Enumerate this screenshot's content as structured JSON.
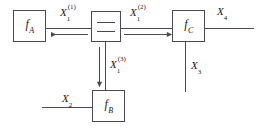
{
  "diagram": {
    "nodes": [
      {
        "id": "f_A",
        "label": "f",
        "subscript": "A",
        "name": "factor-node-fa"
      },
      {
        "id": "equality",
        "label": "=",
        "name": "equality-node"
      },
      {
        "id": "f_C",
        "label": "f",
        "subscript": "C",
        "name": "factor-node-fc"
      },
      {
        "id": "f_B",
        "label": "f",
        "subscript": "B",
        "name": "factor-node-fb"
      }
    ],
    "edge_labels": {
      "x1_1": {
        "base": "X",
        "sub": "1",
        "sup": "(1)"
      },
      "x1_2": {
        "base": "X",
        "sub": "1",
        "sup": "(2)"
      },
      "x1_3": {
        "base": "X",
        "sub": "1",
        "sup": "(3)"
      },
      "x2": {
        "base": "X",
        "sub": "2",
        "sup": ""
      },
      "x3": {
        "base": "X",
        "sub": "3",
        "sup": ""
      },
      "x4": {
        "base": "X",
        "sub": "4",
        "sup": ""
      }
    },
    "arrows": [
      {
        "name": "arrow-to-fa",
        "direction": "left"
      },
      {
        "name": "arrow-to-fc",
        "direction": "right"
      },
      {
        "name": "arrow-to-fb",
        "direction": "down"
      }
    ],
    "colors": {
      "stroke": "#4a4a52",
      "text": "#1a1a1a",
      "background": "#ffffff"
    }
  }
}
